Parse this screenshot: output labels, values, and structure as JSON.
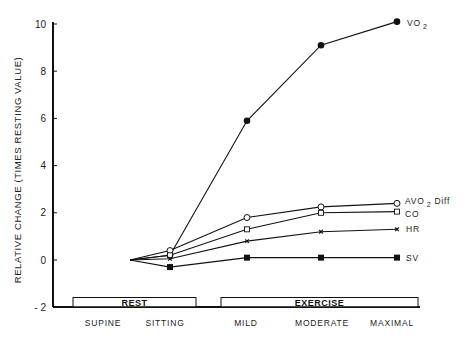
{
  "chart_data": {
    "type": "line",
    "title": "",
    "xlabel": "",
    "ylabel": "RELATIVE CHANGE (TIMES RESTING VALUE)",
    "ylim": [
      -2,
      10
    ],
    "yticks": [
      10,
      8,
      6,
      4,
      2,
      0,
      -2
    ],
    "categories": [
      "SUPINE",
      "SITTING",
      "MILD",
      "MODERATE",
      "MAXIMAL"
    ],
    "bands": [
      {
        "label": "REST",
        "from": "SUPINE",
        "to": "SITTING"
      },
      {
        "label": "EXERCISE",
        "from": "MILD",
        "to": "MAXIMAL"
      }
    ],
    "grid": false,
    "legend": "inline labels at right end of each series",
    "series": [
      {
        "name": "VO2",
        "label_main": "VO",
        "label_sub": "2",
        "marker": "filled-circle",
        "values": [
          0,
          0.2,
          5.9,
          9.1,
          10.1
        ]
      },
      {
        "name": "AVO2 Diff",
        "label_main": "AVO",
        "label_sub": "2",
        "label_tail": "Diff",
        "marker": "open-circle",
        "values": [
          0,
          0.4,
          1.8,
          2.25,
          2.4
        ]
      },
      {
        "name": "CO",
        "label_main": "CO",
        "marker": "open-square",
        "values": [
          0,
          0.2,
          1.3,
          2.0,
          2.05
        ]
      },
      {
        "name": "HR",
        "label_main": "HR",
        "marker": "x",
        "values": [
          0,
          0.05,
          0.8,
          1.2,
          1.3
        ]
      },
      {
        "name": "SV",
        "label_main": "SV",
        "marker": "filled-square",
        "values": [
          0,
          -0.3,
          0.1,
          0.1,
          0.1
        ]
      }
    ]
  }
}
